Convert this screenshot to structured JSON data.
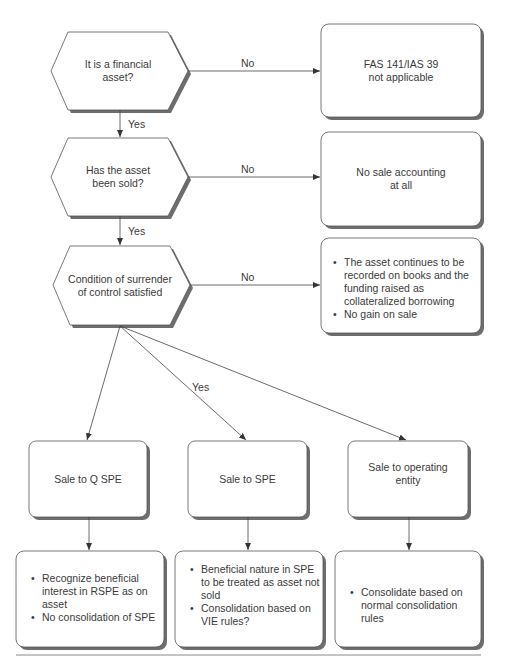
{
  "decisions": [
    {
      "id": "financial-asset",
      "lines": [
        "It is a financial",
        "asset?"
      ]
    },
    {
      "id": "asset-sold",
      "lines": [
        "Has the asset",
        "been sold?"
      ]
    },
    {
      "id": "surrender-control",
      "lines": [
        "Condition of surrender",
        "of control satisfied"
      ]
    }
  ],
  "outcomes": [
    {
      "id": "fas-not-applicable",
      "lines": [
        "FAS 141/IAS 39",
        "not applicable"
      ]
    },
    {
      "id": "no-sale-accounting",
      "lines": [
        "No sale accounting",
        "at all"
      ]
    },
    {
      "id": "collateralized-borrowing",
      "bullets": [
        "The asset continues to be recorded on books and the funding raised as collateralized borrowing",
        "No gain on sale"
      ]
    }
  ],
  "sales": [
    {
      "id": "sale-q-spe",
      "lines": [
        "Sale to Q SPE"
      ]
    },
    {
      "id": "sale-spe",
      "lines": [
        "Sale to SPE"
      ]
    },
    {
      "id": "sale-operating-entity",
      "lines": [
        "Sale to operating",
        "entity"
      ]
    }
  ],
  "treatments": [
    {
      "id": "q-spe-treatment",
      "bullets": [
        "Recognize beneficial interest in RSPE as on asset",
        "No consolidation of SPE"
      ]
    },
    {
      "id": "spe-treatment",
      "bullets": [
        "Beneficial nature in SPE to be treated as asset not sold",
        "Consolidation based on VIE rules?"
      ]
    },
    {
      "id": "operating-entity-treatment",
      "bullets": [
        "Consolidate based on normal consolidation rules"
      ]
    }
  ],
  "edge_labels": {
    "no": "No",
    "yes": "Yes"
  }
}
